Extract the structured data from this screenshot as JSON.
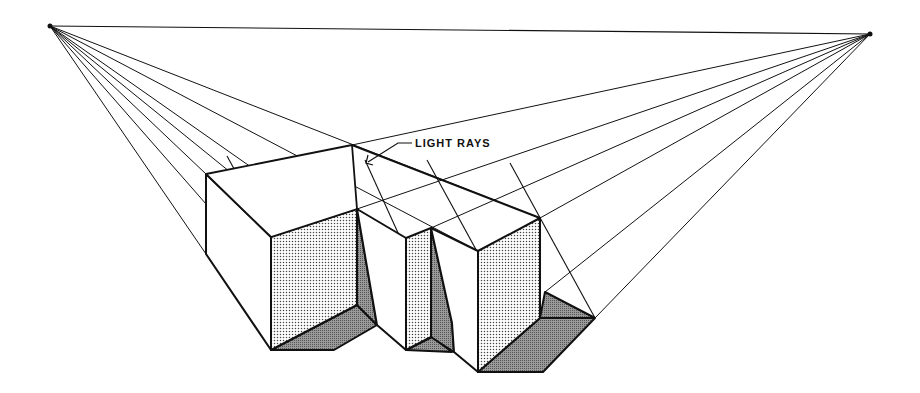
{
  "diagram": {
    "annotation": "LIGHT RAYS",
    "vanishing_points": {
      "left": [
        50,
        26
      ],
      "right": [
        870,
        34
      ]
    },
    "colors": {
      "line": "#111111",
      "light_face": "#d9d9d9",
      "shadow": "#8c8c8c",
      "paper": "#ffffff"
    }
  }
}
